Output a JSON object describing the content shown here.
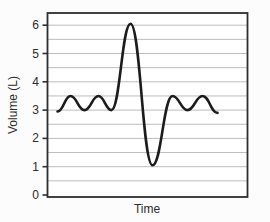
{
  "page": {
    "background": "#fcfcfc"
  },
  "chart_data": {
    "type": "line",
    "title": "",
    "xlabel": "Time",
    "ylabel": "Volume (L)",
    "xlim": [
      0,
      10
    ],
    "ylim": [
      0,
      6.5
    ],
    "yticks": [
      0,
      1,
      2,
      3,
      4,
      5,
      6
    ],
    "xticks": [],
    "grid": "horizontal",
    "gridline_step": 0.5,
    "legend": "none",
    "colors": {
      "line": "#1c1c1c",
      "grid": "#bcbcbc",
      "axis": "#2e2e2e",
      "text": "#2b2b2b",
      "plot_bg": "#ffffff"
    },
    "series": [
      {
        "name": "lung volume trace",
        "description": "Tidal breathing between 3.0 and 3.5 L, deep inspiration to 6.05 L, deep expiration to 1.05 L, then tidal breathing resumes",
        "points": [
          [
            0.5,
            2.95
          ],
          [
            1.15,
            3.5
          ],
          [
            1.85,
            3.0
          ],
          [
            2.55,
            3.5
          ],
          [
            3.2,
            3.0
          ],
          [
            4.15,
            6.05
          ],
          [
            5.25,
            1.05
          ],
          [
            6.25,
            3.5
          ],
          [
            7.0,
            3.0
          ],
          [
            7.75,
            3.5
          ],
          [
            8.5,
            2.9
          ]
        ]
      }
    ]
  }
}
